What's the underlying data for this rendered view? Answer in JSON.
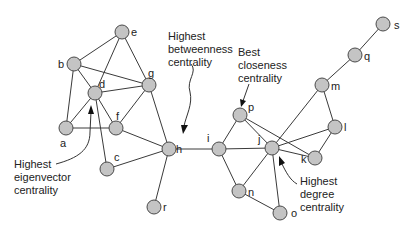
{
  "diagram": {
    "type": "network-graph",
    "node_style": {
      "fill": "#c4c4c4",
      "stroke": "#4a4a4a",
      "radius": 7
    },
    "nodes": [
      {
        "id": "a",
        "x": 66,
        "y": 128,
        "label": "a",
        "lx": 60,
        "ly": 147
      },
      {
        "id": "b",
        "x": 74,
        "y": 64,
        "label": "b",
        "lx": 58,
        "ly": 68
      },
      {
        "id": "c",
        "x": 107,
        "y": 169,
        "label": "c",
        "lx": 114,
        "ly": 161
      },
      {
        "id": "d",
        "x": 95,
        "y": 93,
        "label": "d",
        "lx": 99,
        "ly": 88
      },
      {
        "id": "e",
        "x": 122,
        "y": 32,
        "label": "e",
        "lx": 131,
        "ly": 36
      },
      {
        "id": "f",
        "x": 116,
        "y": 128,
        "label": "f",
        "lx": 116,
        "ly": 120
      },
      {
        "id": "g",
        "x": 149,
        "y": 85,
        "label": "g",
        "lx": 148,
        "ly": 77
      },
      {
        "id": "h",
        "x": 169,
        "y": 149,
        "label": "h",
        "lx": 176,
        "ly": 153
      },
      {
        "id": "i",
        "x": 219,
        "y": 149,
        "label": "i",
        "lx": 207,
        "ly": 142
      },
      {
        "id": "j",
        "x": 272,
        "y": 148,
        "label": "j",
        "lx": 258,
        "ly": 143
      },
      {
        "id": "k",
        "x": 315,
        "y": 158,
        "label": "k",
        "lx": 301,
        "ly": 163
      },
      {
        "id": "l",
        "x": 335,
        "y": 127,
        "label": "l",
        "lx": 344,
        "ly": 131
      },
      {
        "id": "m",
        "x": 322,
        "y": 85,
        "label": "m",
        "lx": 331,
        "ly": 90
      },
      {
        "id": "n",
        "x": 239,
        "y": 191,
        "label": "n",
        "lx": 248,
        "ly": 196
      },
      {
        "id": "o",
        "x": 280,
        "y": 213,
        "label": "o",
        "lx": 291,
        "ly": 217
      },
      {
        "id": "p",
        "x": 240,
        "y": 115,
        "label": "p",
        "lx": 248,
        "ly": 111
      },
      {
        "id": "q",
        "x": 355,
        "y": 55,
        "label": "q",
        "lx": 364,
        "ly": 60
      },
      {
        "id": "r",
        "x": 154,
        "y": 207,
        "label": "r",
        "lx": 163,
        "ly": 211
      },
      {
        "id": "s",
        "x": 383,
        "y": 24,
        "label": "s",
        "lx": 394,
        "ly": 29
      }
    ],
    "edges": [
      [
        "b",
        "e"
      ],
      [
        "e",
        "d"
      ],
      [
        "e",
        "g"
      ],
      [
        "b",
        "d"
      ],
      [
        "b",
        "g"
      ],
      [
        "b",
        "a"
      ],
      [
        "d",
        "g"
      ],
      [
        "d",
        "a"
      ],
      [
        "d",
        "f"
      ],
      [
        "d",
        "c"
      ],
      [
        "a",
        "f"
      ],
      [
        "f",
        "g"
      ],
      [
        "f",
        "h"
      ],
      [
        "g",
        "h"
      ],
      [
        "c",
        "h"
      ],
      [
        "h",
        "r"
      ],
      [
        "h",
        "i"
      ],
      [
        "i",
        "p"
      ],
      [
        "i",
        "j"
      ],
      [
        "i",
        "n"
      ],
      [
        "p",
        "j"
      ],
      [
        "p",
        "k"
      ],
      [
        "j",
        "k"
      ],
      [
        "j",
        "l"
      ],
      [
        "j",
        "m"
      ],
      [
        "j",
        "n"
      ],
      [
        "j",
        "o"
      ],
      [
        "n",
        "o"
      ],
      [
        "m",
        "l"
      ],
      [
        "l",
        "k"
      ],
      [
        "m",
        "q"
      ],
      [
        "q",
        "s"
      ]
    ],
    "annotations": [
      {
        "id": "betweenness",
        "lines": [
          "Highest",
          "betweenness",
          "centrality"
        ],
        "x": 168,
        "y": 40,
        "line_height": 13,
        "target": "h"
      },
      {
        "id": "closeness",
        "lines": [
          "Best",
          "closeness",
          "centrality"
        ],
        "x": 238,
        "y": 56,
        "line_height": 13,
        "target": "p"
      },
      {
        "id": "eigenvector",
        "lines": [
          "Highest",
          "eigenvector",
          "centrality"
        ],
        "x": 14,
        "y": 168,
        "line_height": 13,
        "target": "d"
      },
      {
        "id": "degree",
        "lines": [
          "Highest",
          "degree",
          "centrality"
        ],
        "x": 300,
        "y": 185,
        "line_height": 13,
        "target": "j"
      }
    ]
  }
}
